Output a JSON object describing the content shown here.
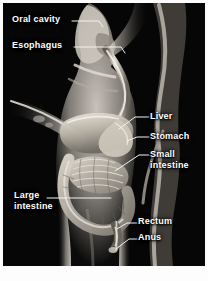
{
  "figure": {
    "kind": "anatomical-illustration",
    "background_color": "#050505",
    "label_color": "#ffffff",
    "leader_color": "#f2f2f2",
    "plate": {
      "x": 3,
      "y": 3,
      "width": 202,
      "height": 263
    }
  },
  "labels": [
    {
      "id": "oral-cavity",
      "text": "Oral cavity",
      "side": "left",
      "x": 12,
      "y": 14,
      "lines": 1
    },
    {
      "id": "esophagus",
      "text": "Esophagus",
      "side": "left",
      "x": 12,
      "y": 40,
      "lines": 1
    },
    {
      "id": "liver",
      "text": "Liver",
      "side": "right",
      "x": 150,
      "y": 111,
      "lines": 1
    },
    {
      "id": "stomach",
      "text": "Stomach",
      "side": "right",
      "x": 150,
      "y": 131,
      "lines": 1
    },
    {
      "id": "small-intestine",
      "text": "Small intestine",
      "line1": "Small",
      "line2": "intestine",
      "side": "right",
      "x": 150,
      "y": 150,
      "lines": 2
    },
    {
      "id": "large-intestine",
      "text": "Large intestine",
      "line1": "Large",
      "line2": "intestine",
      "side": "left",
      "x": 14,
      "y": 191,
      "lines": 2
    },
    {
      "id": "rectum",
      "text": "Rectum",
      "side": "right",
      "x": 138,
      "y": 216,
      "lines": 1
    },
    {
      "id": "anus",
      "text": "Anus",
      "side": "right",
      "x": 138,
      "y": 232,
      "lines": 1
    }
  ],
  "organs": [
    {
      "id": "oral-cavity",
      "name": "Oral cavity"
    },
    {
      "id": "esophagus",
      "name": "Esophagus"
    },
    {
      "id": "liver",
      "name": "Liver"
    },
    {
      "id": "stomach",
      "name": "Stomach"
    },
    {
      "id": "small-intestine",
      "name": "Small intestine"
    },
    {
      "id": "large-intestine",
      "name": "Large intestine"
    },
    {
      "id": "rectum",
      "name": "Rectum"
    },
    {
      "id": "anus",
      "name": "Anus"
    }
  ]
}
